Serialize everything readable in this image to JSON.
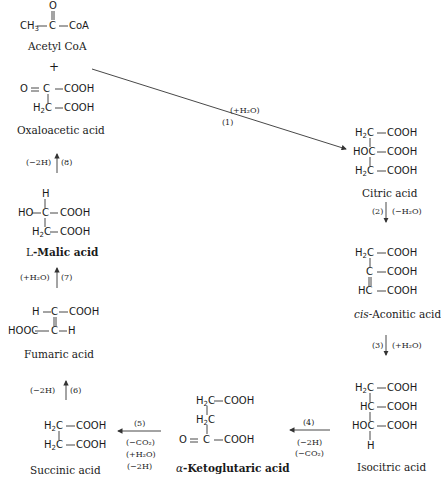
{
  "diagram": {
    "compounds": [
      {
        "id": "acetyl_coa",
        "name": "Acetyl CoA"
      },
      {
        "id": "plus",
        "name": "+"
      },
      {
        "id": "oxaloacetic",
        "name": "Oxaloacetic acid"
      },
      {
        "id": "citric",
        "name": "Citric acid"
      },
      {
        "id": "cis_aconitic",
        "name_prefix": "cis",
        "name": "-Aconitic acid"
      },
      {
        "id": "isocitric",
        "name": "Isocitric acid"
      },
      {
        "id": "ketoglutaric",
        "name_prefix": "α",
        "name": "-Ketoglutaric acid"
      },
      {
        "id": "succinic",
        "name": "Succinic acid"
      },
      {
        "id": "fumaric",
        "name": "Fumaric acid"
      },
      {
        "id": "malic",
        "name_prefix": "L",
        "name": "-Malic acid"
      }
    ],
    "structures": {
      "acetyl_coa": [
        "O",
        "CH3 — C — CoA"
      ],
      "oxaloacetic": [
        "O = C — COOH",
        "H2C — COOH"
      ],
      "citric": [
        "H2C — COOH",
        "HOC — COOH",
        "H2C — COOH"
      ],
      "cis_aconitic": [
        "H2C — COOH",
        "C — COOH",
        "HC — COOH"
      ],
      "isocitric": [
        "H2C — COOH",
        "HC — COOH",
        "HOC — COOH",
        "H"
      ],
      "ketoglutaric": [
        "H2C — COOH",
        "H2C",
        "O = C — COOH"
      ],
      "succinic": [
        "H2C — COOH",
        "H2C — COOH"
      ],
      "fumaric": [
        "H — C — COOH",
        "HOOC — C — H"
      ],
      "malic": [
        "H",
        "HO — C — COOH",
        "H2C — COOH"
      ]
    },
    "steps": [
      {
        "num": "(1)",
        "conditions": [
          "(+H₂O)"
        ]
      },
      {
        "num": "(2)",
        "conditions": [
          "(−H₂O)"
        ]
      },
      {
        "num": "(3)",
        "conditions": [
          "(+H₂O)"
        ]
      },
      {
        "num": "(4)",
        "conditions": [
          "(−2H)",
          "(−CO₂)"
        ]
      },
      {
        "num": "(5)",
        "conditions": [
          "(−CO₂)",
          "(+H₂O)",
          "(−2H)"
        ]
      },
      {
        "num": "(6)",
        "conditions": [
          "(−2H)"
        ]
      },
      {
        "num": "(7)",
        "conditions": [
          "(+H₂O)"
        ]
      },
      {
        "num": "(8)",
        "conditions": [
          "(−2H)"
        ]
      }
    ],
    "atoms": {
      "O": "O",
      "C": "C",
      "CoA": "CoA",
      "CH": "CH",
      "H": "H",
      "HC": "HC",
      "HOC": "HOC",
      "COOH": "COOH",
      "HO": "HO",
      "HOOC": "HOOC",
      "H2": "H",
      "sub2": "2",
      "sub3": "3"
    }
  }
}
